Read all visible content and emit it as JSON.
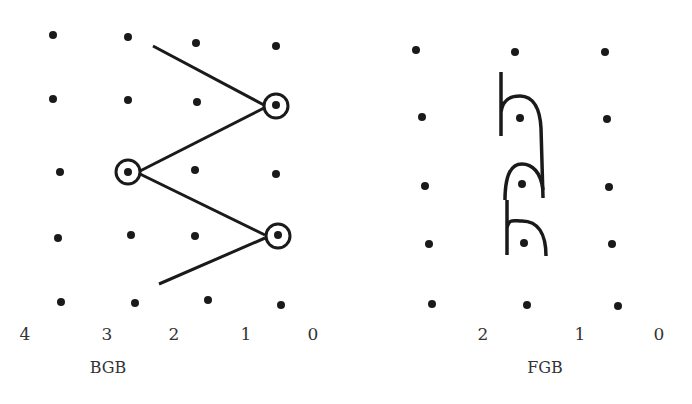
{
  "panels": {
    "bgb": {
      "title": "BGB",
      "title_pos": [
        108,
        368
      ],
      "axis_labels": [
        {
          "text": "4",
          "x": 25,
          "y": 334
        },
        {
          "text": "3",
          "x": 107,
          "y": 334
        },
        {
          "text": "2",
          "x": 174,
          "y": 334
        },
        {
          "text": "1",
          "x": 246,
          "y": 334
        },
        {
          "text": "0",
          "x": 313,
          "y": 334
        }
      ],
      "dots": [
        [
          53,
          35
        ],
        [
          128,
          37
        ],
        [
          196,
          43
        ],
        [
          276,
          46
        ],
        [
          53,
          99
        ],
        [
          128,
          100
        ],
        [
          197,
          102
        ],
        [
          276,
          105
        ],
        [
          60,
          172
        ],
        [
          128,
          172
        ],
        [
          195,
          170
        ],
        [
          276,
          174
        ],
        [
          58,
          238
        ],
        [
          131,
          235
        ],
        [
          195,
          236
        ],
        [
          278,
          235
        ],
        [
          61,
          302
        ],
        [
          135,
          303
        ],
        [
          208,
          300
        ],
        [
          281,
          305
        ]
      ],
      "circled_dots": [
        [
          276,
          106
        ],
        [
          128,
          172
        ],
        [
          278,
          236
        ]
      ],
      "lines": [
        [
          [
            153,
            46
          ],
          [
            264,
            105
          ]
        ],
        [
          [
            264,
            108
          ],
          [
            140,
            171
          ]
        ],
        [
          [
            140,
            174
          ],
          [
            265,
            235
          ]
        ],
        [
          [
            265,
            238
          ],
          [
            159,
            284
          ]
        ]
      ]
    },
    "fgb": {
      "title": "FGB",
      "title_pos": [
        545,
        368
      ],
      "axis_labels": [
        {
          "text": "2",
          "x": 483,
          "y": 334
        },
        {
          "text": "1",
          "x": 580,
          "y": 334
        },
        {
          "text": "0",
          "x": 659,
          "y": 334
        }
      ],
      "dots": [
        [
          416,
          50
        ],
        [
          515,
          52
        ],
        [
          605,
          52
        ],
        [
          422,
          117
        ],
        [
          520,
          118
        ],
        [
          607,
          119
        ],
        [
          425,
          186
        ],
        [
          522,
          184
        ],
        [
          609,
          187
        ],
        [
          429,
          244
        ],
        [
          524,
          243
        ],
        [
          612,
          244
        ],
        [
          432,
          304
        ],
        [
          527,
          305
        ],
        [
          618,
          306
        ]
      ],
      "strand_color": "#1a1a1a"
    }
  }
}
